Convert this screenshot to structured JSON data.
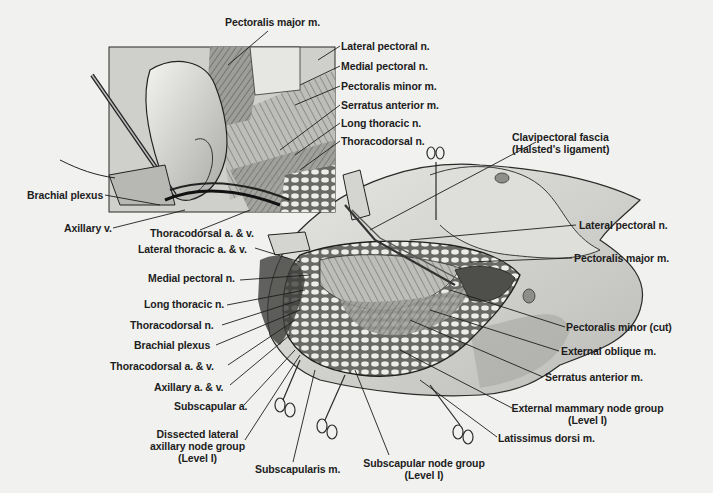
{
  "figure": {
    "type": "surgical anatomical illustration",
    "inset": {
      "labels": [
        {
          "id": "pectoralis-major-inset",
          "text": "Pectoralis major m."
        },
        {
          "id": "lateral-pectoral-inset",
          "text": "Lateral pectoral n."
        },
        {
          "id": "medial-pectoral-inset",
          "text": "Medial pectoral n."
        },
        {
          "id": "pectoralis-minor-inset",
          "text": "Pectoralis minor m."
        },
        {
          "id": "serratus-anterior-inset",
          "text": "Serratus anterior m."
        },
        {
          "id": "long-thoracic-inset",
          "text": "Long thoracic n."
        },
        {
          "id": "thoracodorsal-n-inset",
          "text": "Thoracodorsal n."
        },
        {
          "id": "brachial-plexus-inset",
          "text": "Brachial plexus"
        },
        {
          "id": "axillary-v-inset",
          "text": "Axillary v."
        },
        {
          "id": "thoracodorsal-av-inset",
          "text": "Thoracodorsal a. & v."
        }
      ]
    },
    "main": {
      "left_labels": [
        {
          "id": "lateral-thoracic-av",
          "text": "Lateral thoracic a. & v."
        },
        {
          "id": "medial-pectoral-main",
          "text": "Medial pectoral n."
        },
        {
          "id": "long-thoracic-main",
          "text": "Long thoracic n."
        },
        {
          "id": "thoracodorsal-n-main",
          "text": "Thoracodorsal n."
        },
        {
          "id": "brachial-plexus-main",
          "text": "Brachial plexus"
        },
        {
          "id": "thoracodorsal-av-main",
          "text": "Thoracodorsal a. & v."
        },
        {
          "id": "axillary-av",
          "text": "Axillary a. & v."
        },
        {
          "id": "subscapular-a",
          "text": "Subscapular a."
        }
      ],
      "bottom_labels": [
        {
          "id": "dissected-lateral-axillary",
          "lines": [
            "Dissected lateral",
            "axillary node group",
            "(Level I)"
          ]
        },
        {
          "id": "subscapularis",
          "text": "Subscapularis m."
        },
        {
          "id": "subscapular-node-group",
          "lines": [
            "Subscapular node group",
            "(Level I)"
          ]
        }
      ],
      "right_labels": [
        {
          "id": "clavipectoral-fascia",
          "lines": [
            "Clavipectoral fascia",
            "(Halsted's ligament)"
          ]
        },
        {
          "id": "lateral-pectoral-main",
          "text": "Lateral pectoral n."
        },
        {
          "id": "pectoralis-major-main",
          "text": "Pectoralis major m."
        },
        {
          "id": "pectoralis-minor-cut",
          "text": "Pectoralis minor (cut)"
        },
        {
          "id": "external-oblique",
          "text": "External oblique m."
        },
        {
          "id": "serratus-anterior-main",
          "text": "Serratus anterior m."
        },
        {
          "id": "external-mammary-node-group",
          "lines": [
            "External mammary node group",
            "(Level I)"
          ]
        },
        {
          "id": "latissimus-dorsi",
          "text": "Latissimus dorsi m."
        }
      ]
    },
    "colors": {
      "background": "#f1f1ef",
      "ink": "#1d1d1d",
      "skin": "#d9d9d6",
      "tissue_dark": "#5a5a58",
      "fat_nodes": "#e8e8e4"
    }
  }
}
